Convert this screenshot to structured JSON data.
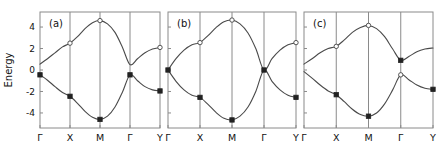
{
  "figure": {
    "width": 448,
    "height": 154,
    "background": "#ffffff",
    "band_color": "#4a4a4a",
    "axis_color": "#8a8a8a",
    "marker_filled_color": "#222222",
    "marker_open_color": "#ffffff"
  },
  "axes": {
    "ylabel": "Energy",
    "yticks": [
      -4,
      -2,
      0,
      2,
      4
    ],
    "yticklabels": [
      "-4",
      "-2",
      "0",
      "2",
      "4"
    ],
    "ylim": [
      -5.4,
      5.4
    ],
    "xticklabels": [
      "Γ",
      "X",
      "M",
      "Γ",
      "Y"
    ],
    "xtick_positions": [
      0,
      1,
      2,
      3,
      4
    ],
    "xlim": [
      0,
      4
    ]
  },
  "chart_data": {
    "type": "line",
    "title": "",
    "xlabel": "",
    "ylabel": "Energy",
    "ylim": [
      -5.4,
      5.4
    ],
    "grid": false,
    "legend": null,
    "xticklabels": [
      "Γ",
      "X",
      "M",
      "Γ",
      "Y"
    ],
    "panels": [
      {
        "label": "(a)",
        "series": [
          {
            "name": "upper-band",
            "x": [
              0.0,
              0.25,
              0.5,
              0.75,
              1.0,
              1.25,
              1.5,
              1.75,
              2.0,
              2.25,
              2.5,
              2.75,
              3.0,
              3.25,
              3.5,
              3.75,
              4.0
            ],
            "y": [
              0.55,
              1.05,
              1.6,
              2.15,
              2.5,
              3.1,
              3.85,
              4.4,
              4.6,
              4.3,
              3.5,
              2.1,
              0.5,
              1.05,
              1.6,
              1.95,
              2.1
            ]
          },
          {
            "name": "lower-band",
            "x": [
              0.0,
              0.25,
              0.5,
              0.75,
              1.0,
              1.25,
              1.5,
              1.75,
              2.0,
              2.25,
              2.5,
              2.75,
              3.0,
              3.25,
              3.5,
              3.75,
              4.0
            ],
            "y": [
              -0.45,
              -0.95,
              -1.55,
              -2.1,
              -2.45,
              -3.1,
              -3.85,
              -4.4,
              -4.6,
              -4.3,
              -3.45,
              -2.05,
              -0.45,
              -1.0,
              -1.55,
              -1.85,
              -1.95
            ]
          }
        ],
        "markers": [
          {
            "x": 0.0,
            "y": -0.45,
            "style": "filled"
          },
          {
            "x": 1.0,
            "y": 2.5,
            "style": "open"
          },
          {
            "x": 1.0,
            "y": -2.45,
            "style": "filled"
          },
          {
            "x": 2.0,
            "y": 4.6,
            "style": "open"
          },
          {
            "x": 2.0,
            "y": -4.6,
            "style": "filled"
          },
          {
            "x": 3.0,
            "y": -0.45,
            "style": "filled"
          },
          {
            "x": 4.0,
            "y": 2.1,
            "style": "open"
          },
          {
            "x": 4.0,
            "y": -1.95,
            "style": "filled"
          }
        ]
      },
      {
        "label": "(b)",
        "series": [
          {
            "name": "upper-band",
            "x": [
              0.0,
              0.25,
              0.5,
              0.75,
              1.0,
              1.25,
              1.5,
              1.75,
              2.0,
              2.25,
              2.5,
              2.75,
              3.0,
              3.25,
              3.5,
              3.75,
              4.0
            ],
            "y": [
              0.0,
              1.05,
              1.85,
              2.35,
              2.55,
              3.2,
              3.95,
              4.5,
              4.65,
              4.3,
              3.45,
              1.95,
              0.0,
              1.05,
              1.85,
              2.35,
              2.55
            ]
          },
          {
            "name": "lower-band",
            "x": [
              0.0,
              0.25,
              0.5,
              0.75,
              1.0,
              1.25,
              1.5,
              1.75,
              2.0,
              2.25,
              2.5,
              2.75,
              3.0,
              3.25,
              3.5,
              3.75,
              4.0
            ],
            "y": [
              0.0,
              -1.05,
              -1.85,
              -2.35,
              -2.55,
              -3.2,
              -3.95,
              -4.5,
              -4.65,
              -4.3,
              -3.45,
              -1.95,
              0.0,
              -1.05,
              -1.85,
              -2.35,
              -2.55
            ]
          }
        ],
        "markers": [
          {
            "x": 0.0,
            "y": 0.0,
            "style": "filled"
          },
          {
            "x": 1.0,
            "y": 2.55,
            "style": "open"
          },
          {
            "x": 1.0,
            "y": -2.55,
            "style": "filled"
          },
          {
            "x": 2.0,
            "y": 4.65,
            "style": "open"
          },
          {
            "x": 2.0,
            "y": -4.65,
            "style": "filled"
          },
          {
            "x": 3.0,
            "y": 0.0,
            "style": "filled"
          },
          {
            "x": 4.0,
            "y": 2.55,
            "style": "open"
          },
          {
            "x": 4.0,
            "y": -2.55,
            "style": "filled"
          }
        ]
      },
      {
        "label": "(c)",
        "series": [
          {
            "name": "upper-band",
            "x": [
              0.0,
              0.25,
              0.5,
              0.75,
              1.0,
              1.25,
              1.5,
              1.75,
              2.0,
              2.25,
              2.5,
              2.75,
              3.0,
              3.25,
              3.5,
              3.75,
              4.0
            ],
            "y": [
              0.55,
              1.05,
              1.6,
              2.0,
              2.2,
              2.8,
              3.5,
              3.95,
              4.15,
              3.85,
              3.1,
              1.95,
              0.9,
              1.25,
              1.7,
              1.95,
              2.05
            ]
          },
          {
            "name": "lower-band",
            "x": [
              0.0,
              0.25,
              0.5,
              0.75,
              1.0,
              1.25,
              1.5,
              1.75,
              2.0,
              2.25,
              2.5,
              2.75,
              3.0,
              3.25,
              3.5,
              3.75,
              4.0
            ],
            "y": [
              -0.15,
              -0.75,
              -1.4,
              -1.95,
              -2.3,
              -2.95,
              -3.65,
              -4.15,
              -4.3,
              -4.0,
              -3.15,
              -1.85,
              -0.45,
              -0.9,
              -1.4,
              -1.7,
              -1.8
            ]
          }
        ],
        "markers": [
          {
            "x": 1.0,
            "y": 2.2,
            "style": "open"
          },
          {
            "x": 1.0,
            "y": -2.3,
            "style": "filled"
          },
          {
            "x": 2.0,
            "y": 4.15,
            "style": "open"
          },
          {
            "x": 2.0,
            "y": -4.3,
            "style": "filled"
          },
          {
            "x": 3.0,
            "y": 0.9,
            "style": "filled"
          },
          {
            "x": 3.0,
            "y": -0.45,
            "style": "open"
          },
          {
            "x": 4.0,
            "y": -1.8,
            "style": "filled"
          }
        ]
      }
    ]
  }
}
